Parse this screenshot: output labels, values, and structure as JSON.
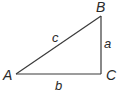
{
  "diagram": {
    "type": "right-triangle",
    "vertices": [
      {
        "id": "A",
        "label": "A"
      },
      {
        "id": "B",
        "label": "B"
      },
      {
        "id": "C",
        "label": "C"
      }
    ],
    "sides": [
      {
        "id": "a",
        "label": "a",
        "between": [
          "B",
          "C"
        ]
      },
      {
        "id": "b",
        "label": "b",
        "between": [
          "A",
          "C"
        ]
      },
      {
        "id": "c",
        "label": "c",
        "between": [
          "A",
          "B"
        ]
      }
    ],
    "right_angle_at": "C",
    "colors": {
      "stroke": "#3a3a3a",
      "text": "#2a2a2a",
      "background": "#ffffff"
    }
  }
}
